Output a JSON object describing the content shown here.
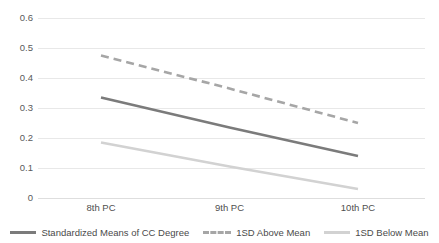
{
  "chart_data": {
    "type": "line",
    "title": "",
    "subtitle": "",
    "xlabel": "",
    "ylabel": "",
    "categories": [
      "8th PC",
      "9th PC",
      "10th PC"
    ],
    "ylim": [
      0,
      0.6
    ],
    "xlim_categories": 3,
    "grid": true,
    "grid_axis": "y",
    "legend_position": "bottom",
    "y_ticks": [
      "0",
      "0.1",
      "0.2",
      "0.3",
      "0.4",
      "0.5",
      "0.6"
    ],
    "y_tick_values": [
      0,
      0.1,
      0.2,
      0.3,
      0.4,
      0.5,
      0.6
    ],
    "series": [
      {
        "name": "Standardized Means of CC Degree",
        "values": [
          0.335,
          0.235,
          0.14
        ],
        "color": "#7b7b7b",
        "style": "solid",
        "width": 2.6
      },
      {
        "name": "1SD Above Mean",
        "values": [
          0.475,
          0.365,
          0.25
        ],
        "color": "#a6a6a6",
        "style": "dashed",
        "width": 2.6
      },
      {
        "name": "1SD Below Mean",
        "values": [
          0.185,
          0.105,
          0.03
        ],
        "color": "#d2d2d2",
        "style": "solid",
        "width": 2.6
      }
    ]
  },
  "legend": {
    "items": [
      {
        "label": "Standardized Means of CC Degree",
        "color": "#7b7b7b",
        "style": "solid"
      },
      {
        "label": "1SD Above Mean",
        "color": "#a6a6a6",
        "style": "dashed"
      },
      {
        "label": "1SD Below Mean",
        "color": "#d2d2d2",
        "style": "solid"
      }
    ]
  },
  "colors": {
    "gridline": "#e8e8e8",
    "background": "#ffffff",
    "text": "#595959"
  }
}
